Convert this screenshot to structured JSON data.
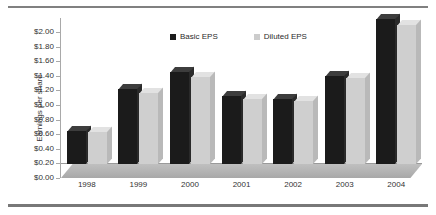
{
  "chart_data": {
    "type": "bar",
    "title": "",
    "xlabel": "",
    "ylabel": "Earnings per share",
    "ylim": [
      0,
      2.0
    ],
    "ytick_step": 0.2,
    "ytick_labels": [
      "$0.00",
      "$0.20",
      "$0.40",
      "$0.60",
      "$0.80",
      "$1.00",
      "$1.20",
      "$1.40",
      "$1.60",
      "$1.80",
      "$2.00"
    ],
    "ytick_values": [
      0,
      0.2,
      0.4,
      0.6,
      0.8,
      1.0,
      1.2,
      1.4,
      1.6,
      1.8,
      2.0
    ],
    "categories": [
      "1998",
      "1999",
      "2000",
      "2001",
      "2002",
      "2003",
      "2004"
    ],
    "series": [
      {
        "name": "Basic EPS",
        "color": "#1b1b1b",
        "values": [
          0.45,
          1.03,
          1.26,
          0.93,
          0.89,
          1.21,
          1.99
        ]
      },
      {
        "name": "Diluted EPS",
        "color": "#cccccc",
        "values": [
          0.44,
          0.97,
          1.19,
          0.89,
          0.86,
          1.18,
          1.9
        ]
      }
    ],
    "grid": false,
    "legend_position": "top-center",
    "style": "3d-column"
  },
  "axis": {
    "y_title": "Earnings per share"
  },
  "legend": {
    "items": [
      {
        "label": "Basic EPS"
      },
      {
        "label": "Diluted EPS"
      }
    ]
  }
}
